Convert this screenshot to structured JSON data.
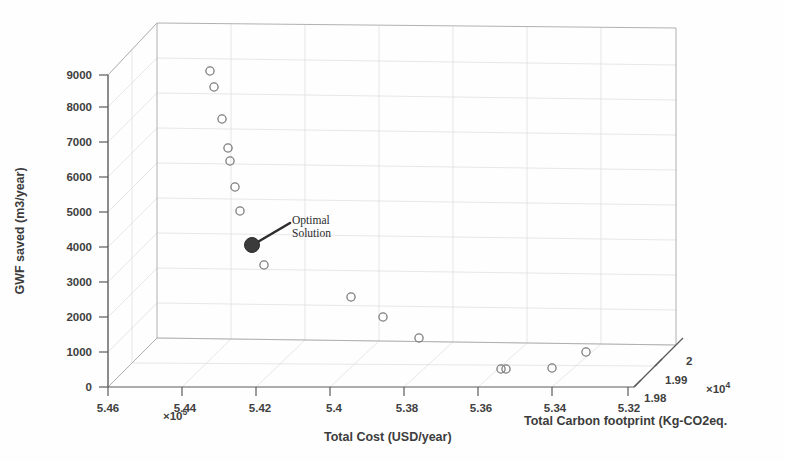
{
  "figure": {
    "background_color": "#fefefe",
    "axis_color": "#555555",
    "grid_color": "#d9d9d9",
    "marker_edge_color": "#777777",
    "optimal_marker_color": "#3b3b3b"
  },
  "axes": {
    "x": {
      "title": "Total Cost (USD/year)",
      "exponent_text": "×10",
      "exponent_power": "5",
      "ticks": [
        "5.46",
        "5.44",
        "5.42",
        "5.4",
        "5.38",
        "5.36",
        "5.34",
        "5.32"
      ],
      "tick_values": [
        546000,
        544000,
        542000,
        540000,
        538000,
        536000,
        534000,
        532000
      ],
      "range": [
        532000,
        546000
      ],
      "direction": "descending-left-to-right"
    },
    "y": {
      "title": "GWF saved (m3/year)",
      "ticks": [
        "0",
        "1000",
        "2000",
        "3000",
        "4000",
        "5000",
        "6000",
        "7000",
        "8000",
        "9000"
      ],
      "tick_values": [
        0,
        1000,
        2000,
        3000,
        4000,
        5000,
        6000,
        7000,
        8000,
        9000
      ],
      "range": [
        0,
        9000
      ]
    },
    "z": {
      "title": "Total Carbon footprint (Kg-CO2eq.",
      "exponent_text": "×10",
      "exponent_power": "4",
      "ticks": [
        "1.98",
        "1.99",
        "2"
      ],
      "tick_values": [
        19800,
        19900,
        20000
      ],
      "range": [
        19800,
        20000
      ]
    }
  },
  "annotation": {
    "line1": "Optimal",
    "line2": "Solution",
    "target_point_index": 10
  },
  "chart_data": {
    "type": "scatter",
    "title": "",
    "xlabel": "Total Cost (USD/year)",
    "ylabel": "GWF saved (m3/year)",
    "zlabel": "Total Carbon footprint (Kg-CO2eq.",
    "xlim": [
      532000,
      546000
    ],
    "ylim": [
      0,
      9000
    ],
    "zlim": [
      19800,
      20000
    ],
    "grid": true,
    "legend": null,
    "projection": "3d",
    "marker": "open-circle",
    "series": [
      {
        "name": "Pareto solutions",
        "points": [
          {
            "x": 543050,
            "y": 9050,
            "z": 19990,
            "optimal": false
          },
          {
            "x": 542900,
            "y": 8650,
            "z": 19988,
            "optimal": false
          },
          {
            "x": 542750,
            "y": 7680,
            "z": 19985,
            "optimal": false
          },
          {
            "x": 542650,
            "y": 6850,
            "z": 19982,
            "optimal": false
          },
          {
            "x": 542600,
            "y": 6450,
            "z": 19980,
            "optimal": false
          },
          {
            "x": 542500,
            "y": 5700,
            "z": 19977,
            "optimal": false
          },
          {
            "x": 542400,
            "y": 5030,
            "z": 19974,
            "optimal": false
          },
          {
            "x": 542100,
            "y": 4000,
            "z": 19970,
            "optimal": true
          },
          {
            "x": 541900,
            "y": 3540,
            "z": 19966,
            "optimal": false
          },
          {
            "x": 540000,
            "y": 2480,
            "z": 19950,
            "optimal": false
          },
          {
            "x": 539200,
            "y": 1960,
            "z": 19942,
            "optimal": false
          },
          {
            "x": 538200,
            "y": 1350,
            "z": 19934,
            "optimal": false
          },
          {
            "x": 536050,
            "y": 420,
            "z": 19914,
            "optimal": false
          },
          {
            "x": 535950,
            "y": 420,
            "z": 19913,
            "optimal": false
          },
          {
            "x": 534700,
            "y": 520,
            "z": 19902,
            "optimal": false
          },
          {
            "x": 533600,
            "y": 980,
            "z": 19892,
            "optimal": false
          }
        ]
      }
    ]
  },
  "marker_pixels": {
    "open": [
      {
        "cx": 210,
        "cy": 71
      },
      {
        "cx": 214,
        "cy": 87
      },
      {
        "cx": 222,
        "cy": 119
      },
      {
        "cx": 228,
        "cy": 148
      },
      {
        "cx": 230,
        "cy": 161
      },
      {
        "cx": 235,
        "cy": 187
      },
      {
        "cx": 240,
        "cy": 211
      },
      {
        "cx": 264,
        "cy": 265
      },
      {
        "cx": 351,
        "cy": 297
      },
      {
        "cx": 383,
        "cy": 317
      },
      {
        "cx": 419,
        "cy": 338
      },
      {
        "cx": 501,
        "cy": 369
      },
      {
        "cx": 506,
        "cy": 369
      },
      {
        "cx": 552,
        "cy": 368
      },
      {
        "cx": 586,
        "cy": 352
      }
    ],
    "optimal": {
      "cx": 252,
      "cy": 245,
      "r": 7.5
    },
    "leader": {
      "x1": 256,
      "y1": 243,
      "x2": 290,
      "y2": 223
    }
  },
  "geometry": {
    "front_bottom_left": {
      "x": 108,
      "y": 387
    },
    "front_bottom_right": {
      "x": 634,
      "y": 387
    },
    "front_top_left": {
      "x": 108,
      "y": 75
    },
    "back_bottom_left": {
      "x": 157,
      "y": 338
    },
    "back_bottom_right": {
      "x": 676,
      "y": 345
    },
    "back_top_left": {
      "x": 157,
      "y": 23
    },
    "back_top_right": {
      "x": 676,
      "y": 28
    }
  }
}
